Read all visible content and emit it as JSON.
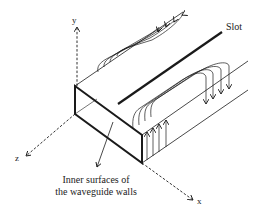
{
  "diagram": {
    "labels": {
      "slot": "Slot",
      "axis_x": "x",
      "axis_y": "y",
      "axis_z": "z",
      "caption_line1": "Inner surfaces of",
      "caption_line2": "the waveguide walls"
    },
    "colors": {
      "stroke": "#1a1a1a",
      "background": "#ffffff"
    }
  }
}
